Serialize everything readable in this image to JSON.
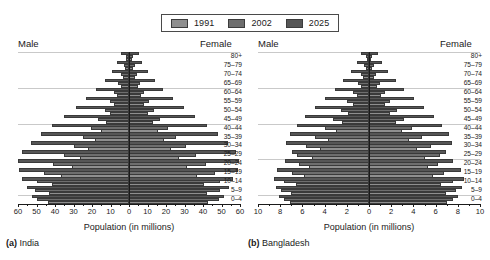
{
  "legend": {
    "items": [
      {
        "label": "1991",
        "color": "#8f8f8f"
      },
      {
        "label": "2002",
        "color": "#6e6e6e"
      },
      {
        "label": "2025",
        "color": "#565656"
      }
    ]
  },
  "headers": {
    "male_a": "Male",
    "female_a": "Female",
    "male_b": "Male",
    "female_b": "Female"
  },
  "axis_title": "Population (in millions)",
  "captions": {
    "a_prefix": "(a)",
    "a_name": "India",
    "b_prefix": "(b)",
    "b_name": "Bangladesh"
  },
  "age_groups": [
    "80+",
    "75–79",
    "70–74",
    "65–69",
    "60–64",
    "55–59",
    "50–54",
    "45–49",
    "40–44",
    "35–39",
    "30–34",
    "25–29",
    "20–24",
    "15–19",
    "10–14",
    "5–9",
    "0–4"
  ],
  "chart_data": [
    {
      "type": "bar",
      "subtype": "population-pyramid",
      "title": "India",
      "caption": "(a) India",
      "xlabel": "Population (in millions)",
      "ylabel": "",
      "categories": [
        "80+",
        "75–79",
        "70–74",
        "65–69",
        "60–64",
        "55–59",
        "50–54",
        "45–49",
        "40–44",
        "35–39",
        "30–34",
        "25–29",
        "20–24",
        "15–19",
        "10–14",
        "5–9",
        "0–4"
      ],
      "xlim": [
        -60,
        60
      ],
      "xticks": [
        60,
        50,
        40,
        30,
        20,
        10,
        0,
        10,
        20,
        30,
        40,
        50,
        60
      ],
      "grid": true,
      "legend_position": "top-center",
      "series": [
        {
          "name": "1991",
          "side": "male",
          "values": [
            1.4,
            2.0,
            3.2,
            4.6,
            6.4,
            8.0,
            10.2,
            12.6,
            15.4,
            18.6,
            22.4,
            26.4,
            31.0,
            36.6,
            41.8,
            43.2,
            43.8
          ]
        },
        {
          "name": "2002",
          "side": "male",
          "values": [
            1.9,
            2.8,
            4.2,
            5.9,
            8.0,
            10.4,
            13.2,
            16.6,
            20.6,
            25.0,
            30.0,
            35.4,
            41.0,
            46.2,
            50.0,
            50.6,
            50.0
          ]
        },
        {
          "name": "2025",
          "side": "male",
          "values": [
            4.6,
            6.4,
            9.4,
            13.2,
            17.8,
            23.0,
            28.8,
            35.0,
            41.4,
            47.6,
            53.2,
            57.8,
            60.0,
            59.4,
            57.6,
            55.2,
            52.4
          ]
        },
        {
          "name": "1991",
          "side": "female",
          "values": [
            1.5,
            2.1,
            3.3,
            4.7,
            6.5,
            8.2,
            10.4,
            12.9,
            15.7,
            19.0,
            22.8,
            26.9,
            31.6,
            37.0,
            40.8,
            42.2,
            42.6
          ]
        },
        {
          "name": "2002",
          "side": "female",
          "values": [
            2.1,
            3.0,
            4.4,
            6.1,
            8.3,
            10.7,
            13.6,
            17.0,
            21.0,
            25.5,
            30.6,
            36.0,
            41.4,
            46.4,
            49.0,
            49.4,
            48.8
          ]
        },
        {
          "name": "2025",
          "side": "female",
          "values": [
            5.4,
            7.2,
            10.2,
            14.0,
            18.6,
            23.8,
            29.6,
            35.8,
            42.0,
            48.0,
            53.4,
            57.8,
            59.6,
            58.8,
            56.4,
            54.0,
            51.2
          ]
        }
      ]
    },
    {
      "type": "bar",
      "subtype": "population-pyramid",
      "title": "Bangladesh",
      "caption": "(b) Bangladesh",
      "xlabel": "Population (in millions)",
      "ylabel": "",
      "categories": [
        "80+",
        "75–79",
        "70–74",
        "65–69",
        "60–64",
        "55–59",
        "50–54",
        "45–49",
        "40–44",
        "35–39",
        "30–34",
        "25–29",
        "20–24",
        "15–19",
        "10–14",
        "5–9",
        "0–4"
      ],
      "xlim": [
        -10,
        10
      ],
      "xticks": [
        10,
        8,
        6,
        4,
        2,
        0,
        2,
        4,
        6,
        8,
        10
      ],
      "grid": true,
      "legend_position": "top-center",
      "series": [
        {
          "name": "1991",
          "side": "male",
          "values": [
            0.18,
            0.3,
            0.5,
            0.76,
            1.1,
            1.46,
            1.92,
            2.42,
            3.0,
            3.7,
            4.4,
            5.1,
            5.4,
            5.9,
            6.6,
            7.0,
            7.1
          ]
        },
        {
          "name": "2002",
          "side": "male",
          "values": [
            0.26,
            0.42,
            0.68,
            1.02,
            1.46,
            1.94,
            2.52,
            3.2,
            3.96,
            4.84,
            5.72,
            6.46,
            6.3,
            6.9,
            7.7,
            7.9,
            7.7
          ]
        },
        {
          "name": "2025",
          "side": "male",
          "values": [
            0.7,
            1.08,
            1.62,
            2.3,
            3.08,
            3.96,
            4.86,
            5.74,
            6.52,
            7.14,
            7.44,
            6.9,
            7.6,
            8.3,
            8.6,
            8.4,
            8.1
          ]
        },
        {
          "name": "1991",
          "side": "female",
          "values": [
            0.17,
            0.29,
            0.48,
            0.74,
            1.08,
            1.44,
            1.9,
            2.4,
            2.96,
            3.64,
            4.32,
            5.0,
            5.3,
            5.8,
            6.5,
            6.9,
            7.0
          ]
        },
        {
          "name": "2002",
          "side": "female",
          "values": [
            0.25,
            0.41,
            0.66,
            1.0,
            1.44,
            1.92,
            2.5,
            3.16,
            3.9,
            4.76,
            5.62,
            6.36,
            6.2,
            6.8,
            7.6,
            7.8,
            7.6
          ]
        },
        {
          "name": "2025",
          "side": "female",
          "values": [
            0.78,
            1.16,
            1.72,
            2.4,
            3.18,
            4.06,
            4.94,
            5.82,
            6.58,
            7.18,
            7.46,
            6.94,
            7.6,
            8.26,
            8.54,
            8.34,
            8.04
          ]
        }
      ]
    }
  ]
}
